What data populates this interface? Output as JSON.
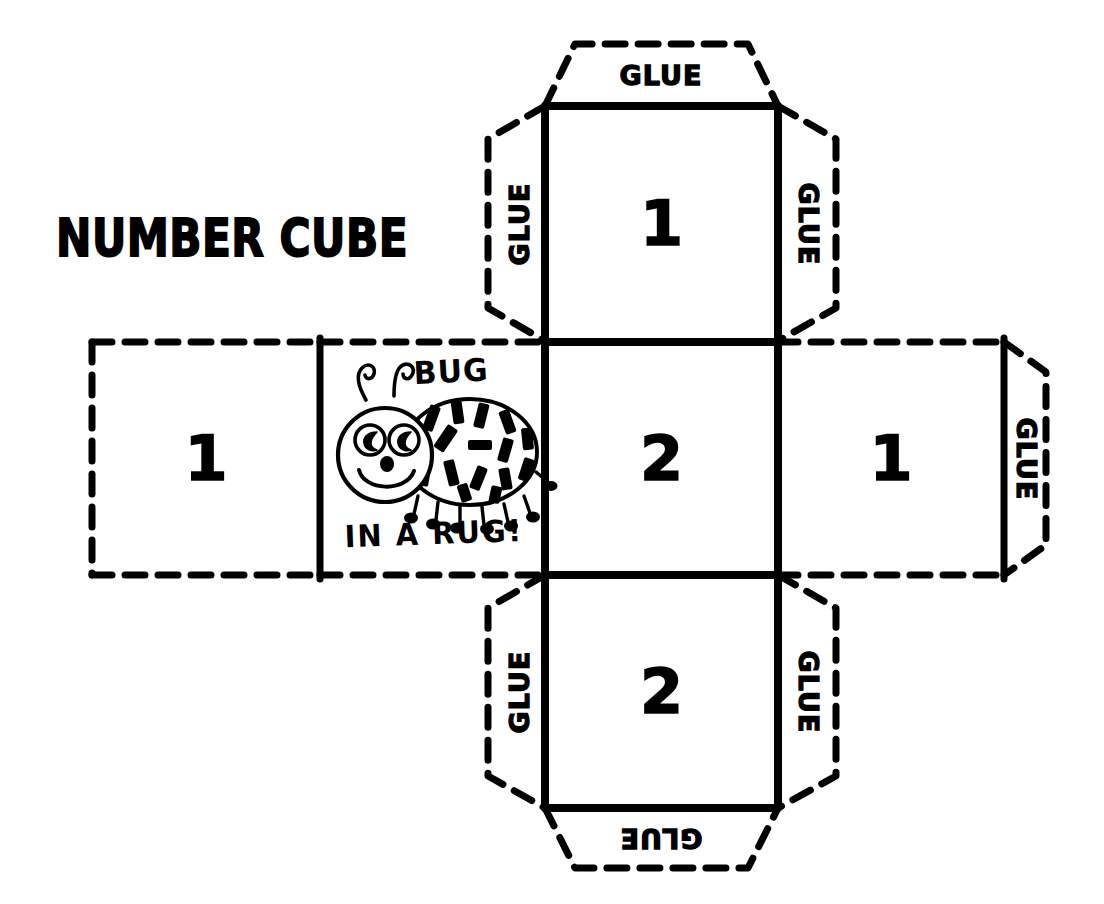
{
  "document": {
    "title": "NUMBER CUBE",
    "type": "cube net craft template",
    "ink_color": "#000000",
    "paper_color": "#ffffff"
  },
  "title": {
    "text": "NUMBER CUBE"
  },
  "net": {
    "shape": "cross",
    "faces": [
      {
        "id": "top",
        "label": "1",
        "position": "top",
        "border": "solid"
      },
      {
        "id": "left",
        "label": "1",
        "position": "middle-left",
        "border": "dashed"
      },
      {
        "id": "bug",
        "label": "",
        "position": "middle-inner-left",
        "border": "mixed"
      },
      {
        "id": "center",
        "label": "2",
        "position": "middle-center",
        "border": "solid"
      },
      {
        "id": "right",
        "label": "1",
        "position": "middle-right",
        "border": "dashed"
      },
      {
        "id": "bottom",
        "label": "2",
        "position": "bottom",
        "border": "solid"
      }
    ]
  },
  "glue_tabs": [
    {
      "id": "top-top",
      "label": "GLUE",
      "rotation": 0,
      "attached_to": "top"
    },
    {
      "id": "top-left",
      "label": "GLUE",
      "rotation": -90,
      "attached_to": "top"
    },
    {
      "id": "top-right",
      "label": "GLUE",
      "rotation": 90,
      "attached_to": "top"
    },
    {
      "id": "right-right",
      "label": "GLUE",
      "rotation": 90,
      "attached_to": "right"
    },
    {
      "id": "bottom-left",
      "label": "GLUE",
      "rotation": -90,
      "attached_to": "bottom"
    },
    {
      "id": "bottom-right",
      "label": "GLUE",
      "rotation": 90,
      "attached_to": "bottom"
    },
    {
      "id": "bottom-bottom",
      "label": "GLUE",
      "rotation": 180,
      "attached_to": "bottom"
    }
  ],
  "bug_panel": {
    "word_top": "BUG",
    "word_bottom": "IN A RUG!",
    "illustration": "ladybug-drawing"
  }
}
